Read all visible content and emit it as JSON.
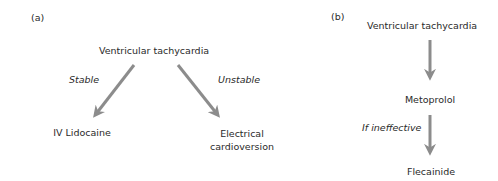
{
  "panel_a": {
    "label": "(a)",
    "root": "Ventricular tachycardia",
    "left_condition": "Stable",
    "right_condition": "Unstable",
    "left_outcome": "IV Lidocaine",
    "right_outcome_line1": "Electrical",
    "right_outcome_line2": "cardioversion"
  },
  "panel_b": {
    "label": "(b)",
    "root": "Ventricular tachycardia",
    "step1": "Metoprolol",
    "condition": "If ineffective",
    "step2": "Flecainide"
  },
  "colors": {
    "arrow": "#8c8c8c",
    "text": "#2a2a2a"
  }
}
